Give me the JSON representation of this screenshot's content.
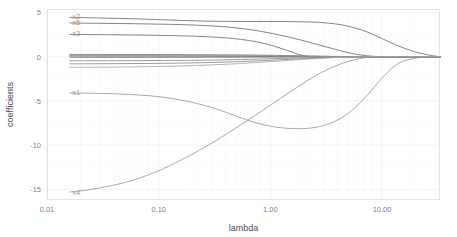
{
  "chart_data": {
    "type": "line",
    "title": "",
    "xlabel": "lambda",
    "ylabel": "coefficients",
    "x_scale": "log10",
    "xlim": [
      0.01,
      33.0
    ],
    "ylim": [
      -16.2,
      5.4
    ],
    "grid": true,
    "legend_position": "inline-left-labels",
    "x_tick_labels": [
      "0.01",
      "0.10",
      "1.00",
      "10.00"
    ],
    "x_tick_values": [
      0.01,
      0.1,
      1.0,
      10.0
    ],
    "y_tick_labels": [
      "5",
      "0",
      "-5",
      "-10",
      "-15"
    ],
    "y_tick_values": [
      5,
      0,
      -5,
      -10,
      -15
    ],
    "x": [
      0.016,
      0.022,
      0.03,
      0.042,
      0.058,
      0.08,
      0.11,
      0.15,
      0.21,
      0.29,
      0.4,
      0.55,
      0.76,
      1.05,
      1.45,
      2.0,
      2.75,
      3.8,
      5.2,
      7.2,
      10.0,
      13.8,
      19.0,
      26.0,
      33.0
    ],
    "series": [
      {
        "name": "x2",
        "label": "x2",
        "color": "#6e6e6e",
        "label_x": 0.016,
        "label_y": 4.55,
        "values": [
          4.45,
          4.42,
          4.38,
          4.34,
          4.3,
          4.24,
          4.18,
          4.12,
          4.06,
          4.02,
          4.0,
          3.99,
          3.99,
          3.99,
          3.98,
          3.95,
          3.88,
          3.72,
          3.4,
          2.85,
          2.05,
          1.25,
          0.62,
          0.2,
          0.0
        ]
      },
      {
        "name": "x5",
        "label": "x5",
        "color": "#6e6e6e",
        "label_x": 0.016,
        "label_y": 3.9,
        "values": [
          3.82,
          3.8,
          3.78,
          3.76,
          3.74,
          3.71,
          3.68,
          3.64,
          3.58,
          3.5,
          3.38,
          3.2,
          2.95,
          2.62,
          2.24,
          1.8,
          1.32,
          0.84,
          0.4,
          0.12,
          0.0,
          0.0,
          0.0,
          0.0,
          0.0
        ]
      },
      {
        "name": "x3",
        "label": "x3",
        "color": "#6e6e6e",
        "label_x": 0.016,
        "label_y": 2.6,
        "values": [
          2.52,
          2.51,
          2.5,
          2.48,
          2.46,
          2.44,
          2.41,
          2.37,
          2.32,
          2.25,
          2.14,
          1.96,
          1.68,
          1.25,
          0.66,
          0.1,
          0.0,
          0.0,
          0.0,
          0.0,
          0.0,
          0.0,
          0.0,
          0.0,
          0.0
        ]
      },
      {
        "name": "x1",
        "label": "x1",
        "color": "#9a9a9a",
        "label_x": 0.016,
        "label_y": -4.05,
        "values": [
          -4.1,
          -4.12,
          -4.15,
          -4.2,
          -4.28,
          -4.4,
          -4.58,
          -4.85,
          -5.22,
          -5.7,
          -6.28,
          -6.92,
          -7.5,
          -7.9,
          -8.1,
          -8.12,
          -7.9,
          -7.3,
          -6.2,
          -4.5,
          -2.4,
          -0.8,
          -0.2,
          -0.02,
          0.0
        ]
      },
      {
        "name": "x4",
        "label": "x4",
        "color": "#9a9a9a",
        "label_x": 0.016,
        "label_y": -15.3,
        "values": [
          -15.3,
          -15.1,
          -14.82,
          -14.45,
          -13.98,
          -13.38,
          -12.66,
          -11.82,
          -10.88,
          -9.86,
          -8.78,
          -7.66,
          -6.5,
          -5.3,
          -4.1,
          -2.95,
          -1.9,
          -1.05,
          -0.45,
          -0.1,
          0.0,
          0.0,
          0.0,
          0.0,
          0.0
        ]
      },
      {
        "name": "noise-a",
        "label": "",
        "color": "#6e6e6e",
        "label_x": null,
        "label_y": null,
        "values": [
          0.26,
          0.26,
          0.26,
          0.25,
          0.25,
          0.25,
          0.24,
          0.24,
          0.23,
          0.22,
          0.21,
          0.2,
          0.18,
          0.16,
          0.13,
          0.1,
          0.07,
          0.04,
          0.02,
          0.0,
          0.0,
          0.0,
          0.0,
          0.0,
          0.0
        ]
      },
      {
        "name": "noise-b",
        "label": "",
        "color": "#5a5a5a",
        "label_x": null,
        "label_y": null,
        "values": [
          0.1,
          0.1,
          0.1,
          0.1,
          0.1,
          0.1,
          0.09,
          0.09,
          0.09,
          0.08,
          0.08,
          0.07,
          0.06,
          0.05,
          0.04,
          0.03,
          0.02,
          0.01,
          0.0,
          0.0,
          0.0,
          0.0,
          0.0,
          0.0,
          0.0
        ]
      },
      {
        "name": "noise-c",
        "label": "",
        "color": "#555555",
        "label_x": null,
        "label_y": null,
        "values": [
          -0.05,
          -0.05,
          -0.05,
          -0.05,
          -0.05,
          -0.05,
          -0.05,
          -0.05,
          -0.05,
          -0.04,
          -0.04,
          -0.04,
          -0.03,
          -0.03,
          -0.02,
          -0.02,
          -0.01,
          0.0,
          0.0,
          0.0,
          0.0,
          0.0,
          0.0,
          0.0,
          0.0
        ]
      },
      {
        "name": "noise-d",
        "label": "",
        "color": "#8a8a8a",
        "label_x": null,
        "label_y": null,
        "values": [
          -0.45,
          -0.45,
          -0.45,
          -0.44,
          -0.44,
          -0.43,
          -0.42,
          -0.41,
          -0.4,
          -0.38,
          -0.35,
          -0.31,
          -0.27,
          -0.22,
          -0.17,
          -0.12,
          -0.07,
          -0.03,
          -0.01,
          0.0,
          0.0,
          0.0,
          0.0,
          0.0,
          0.0
        ]
      },
      {
        "name": "noise-e",
        "label": "",
        "color": "#8a8a8a",
        "label_x": null,
        "label_y": null,
        "values": [
          -0.8,
          -0.8,
          -0.79,
          -0.78,
          -0.77,
          -0.76,
          -0.74,
          -0.72,
          -0.69,
          -0.65,
          -0.6,
          -0.54,
          -0.47,
          -0.39,
          -0.3,
          -0.22,
          -0.14,
          -0.07,
          -0.02,
          0.0,
          0.0,
          0.0,
          0.0,
          0.0,
          0.0
        ]
      },
      {
        "name": "noise-f",
        "label": "",
        "color": "#a8a8a8",
        "label_x": null,
        "label_y": null,
        "values": [
          -1.2,
          -1.19,
          -1.18,
          -1.17,
          -1.15,
          -1.12,
          -1.09,
          -1.05,
          -1.0,
          -0.93,
          -0.85,
          -0.76,
          -0.65,
          -0.53,
          -0.41,
          -0.29,
          -0.18,
          -0.09,
          -0.03,
          0.0,
          0.0,
          0.0,
          0.0,
          0.0,
          0.0
        ]
      },
      {
        "name": "noise-g",
        "label": "",
        "color": "#9e9e9e",
        "label_x": null,
        "label_y": null,
        "values": [
          0.18,
          0.18,
          0.18,
          0.18,
          0.17,
          0.17,
          0.17,
          0.16,
          0.16,
          0.15,
          0.14,
          0.13,
          0.11,
          0.09,
          0.07,
          0.05,
          0.03,
          0.015,
          0.0,
          0.0,
          0.0,
          0.0,
          0.0,
          0.0,
          0.0
        ]
      }
    ]
  },
  "axes": {
    "x_title": "lambda",
    "y_title": "coefficients"
  }
}
